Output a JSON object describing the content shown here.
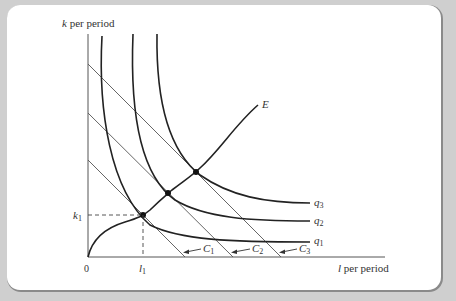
{
  "figure": {
    "y_axis_label_var": "k",
    "y_axis_label_rest": " per period",
    "x_axis_label_var": "l",
    "x_axis_label_rest": " per period",
    "origin_label": "0",
    "k1_var": "k",
    "k1_sub": "1",
    "l1_var": "l",
    "l1_sub": "1",
    "expansion_path_label": "E",
    "isoquants": [
      {
        "var": "q",
        "sub": "1"
      },
      {
        "var": "q",
        "sub": "2"
      },
      {
        "var": "q",
        "sub": "3"
      }
    ],
    "isocosts": [
      {
        "var": "C",
        "sub": "1"
      },
      {
        "var": "C",
        "sub": "2"
      },
      {
        "var": "C",
        "sub": "3"
      }
    ],
    "colors": {
      "background": "#cfcfcf",
      "card": "#ffffff",
      "curves": "#222222",
      "lines": "#555555"
    }
  }
}
